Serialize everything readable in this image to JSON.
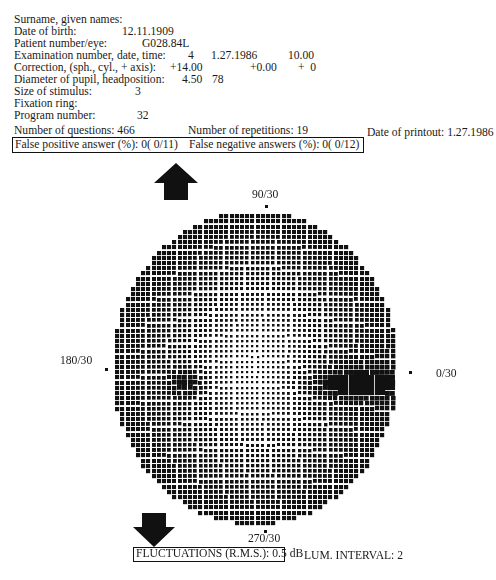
{
  "header": {
    "surname_label": "Surname, given names:",
    "dob_label": "Date of birth:",
    "dob_value": "12.11.1909",
    "patient_label": "Patient number/eye:",
    "patient_value": "G028.84L",
    "exam_label": "Examination number, date, time:",
    "exam_number": "4",
    "exam_date": "1.27.1986",
    "exam_time": "10.00",
    "correction_label": "Correction, (sph., cyl., + axis):",
    "correction_sph": "+14.00",
    "correction_cyl": "+0.00",
    "correction_axis": "+  0",
    "pupil_label": "Diameter of pupil, headposition:",
    "pupil_value": "4.50",
    "headposition_value": "78",
    "stimulus_label": "Size of stimulus:",
    "stimulus_value": "3",
    "fixation_label": "Fixation ring:",
    "program_label": "Program number:",
    "program_value": "32"
  },
  "stats": {
    "questions": "Number of questions: 466",
    "repetitions": "Number of repetitions: 19",
    "printout_date": "Date of printout: 1.27.1986",
    "false_positive": "False positive answer (%): 0( 0/11)",
    "false_negative": "False negative answers (%): 0( 0/12)"
  },
  "field": {
    "label_top": "90/30",
    "label_left": "180/30",
    "label_right": "0/30",
    "label_bottom": "270/30",
    "arrow_up_icon": "arrow-up-icon",
    "arrow_down_icon": "arrow-down-icon",
    "ink_color": "#111111"
  },
  "footer": {
    "fluctuations": "FLUCTUATIONS (R.M.S.): 0.5 dB",
    "lum_interval": "LUM. INTERVAL: 2"
  }
}
